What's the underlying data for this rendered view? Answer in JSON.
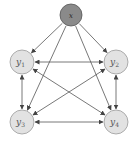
{
  "diagram": {
    "type": "directed-graph",
    "nodes": [
      {
        "id": "x",
        "label": "x",
        "sub": "",
        "cx": 71,
        "cy": 15,
        "r": 11,
        "fill": "#8a8a8a",
        "stroke": "#555555",
        "observed": true
      },
      {
        "id": "y1",
        "label": "y",
        "sub": "1",
        "cx": 22,
        "cy": 62,
        "r": 12,
        "fill": "#e2e2e2",
        "stroke": "#9a9a9a"
      },
      {
        "id": "y2",
        "label": "y",
        "sub": "2",
        "cx": 116,
        "cy": 62,
        "r": 12,
        "fill": "#e2e2e2",
        "stroke": "#9a9a9a"
      },
      {
        "id": "y3",
        "label": "y",
        "sub": "3",
        "cx": 22,
        "cy": 122,
        "r": 12,
        "fill": "#e2e2e2",
        "stroke": "#9a9a9a"
      },
      {
        "id": "y4",
        "label": "y",
        "sub": "4",
        "cx": 116,
        "cy": 122,
        "r": 12,
        "fill": "#e2e2e2",
        "stroke": "#9a9a9a"
      }
    ],
    "edges": [
      {
        "from": "x",
        "to": "y1",
        "bidirectional": false
      },
      {
        "from": "x",
        "to": "y2",
        "bidirectional": false
      },
      {
        "from": "x",
        "to": "y3",
        "bidirectional": false
      },
      {
        "from": "x",
        "to": "y4",
        "bidirectional": false
      },
      {
        "from": "y1",
        "to": "y2",
        "bidirectional": true
      },
      {
        "from": "y1",
        "to": "y3",
        "bidirectional": true
      },
      {
        "from": "y1",
        "to": "y4",
        "bidirectional": true
      },
      {
        "from": "y2",
        "to": "y3",
        "bidirectional": true
      },
      {
        "from": "y2",
        "to": "y4",
        "bidirectional": true
      },
      {
        "from": "y3",
        "to": "y4",
        "bidirectional": true
      }
    ],
    "edge_color": "#555555"
  }
}
